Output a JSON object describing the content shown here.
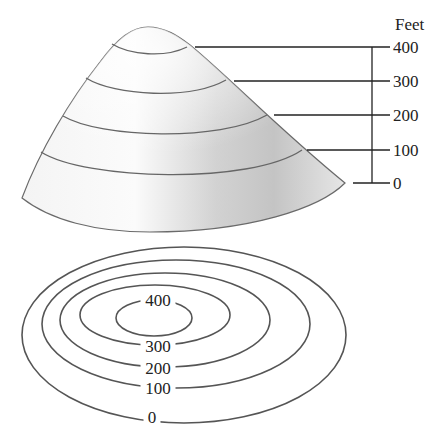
{
  "diagram": {
    "type": "contour-map-illustration",
    "units_label": "Feet",
    "elevation_axis": {
      "ticks": [
        {
          "label": "400",
          "y": 47,
          "leader_start_x": 195
        },
        {
          "label": "300",
          "y": 81,
          "leader_start_x": 234
        },
        {
          "label": "200",
          "y": 115,
          "leader_start_x": 274
        },
        {
          "label": "100",
          "y": 150,
          "leader_start_x": 307
        },
        {
          "label": "0",
          "y": 183,
          "leader_start_x": 353
        }
      ]
    },
    "contour_map": {
      "contours": [
        {
          "label": "400",
          "cx": 154,
          "cy": 318,
          "rx": 38,
          "ry": 18,
          "label_x": 158,
          "label_y": 306
        },
        {
          "label": "300",
          "cx": 155,
          "cy": 315,
          "rx": 75,
          "ry": 30,
          "label_x": 158,
          "label_y": 352
        },
        {
          "label": "200",
          "cx": 165,
          "cy": 320,
          "rx": 105,
          "ry": 47,
          "label_x": 158,
          "label_y": 374
        },
        {
          "label": "100",
          "cx": 176,
          "cy": 324,
          "rx": 134,
          "ry": 64,
          "label_x": 158,
          "label_y": 394
        },
        {
          "label": "0",
          "cx": 184,
          "cy": 335,
          "rx": 162,
          "ry": 88,
          "label_x": 152,
          "label_y": 423
        }
      ]
    },
    "colors": {
      "line": "#555555",
      "leader": "#222222",
      "surface_light": "#f6f6f6",
      "surface_shadow": "#bdbdbd"
    }
  }
}
